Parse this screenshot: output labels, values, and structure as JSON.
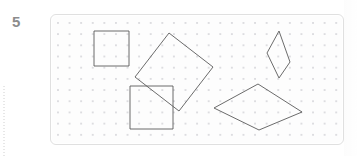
{
  "worksheet": {
    "question_number": "5",
    "panel": {
      "background_color": "#fdfdfd",
      "border_color": "#e0e0e0",
      "dot_color": "#d9d9dd",
      "dot_spacing_x": 11.6,
      "dot_spacing_y": 11.2,
      "width": 294,
      "height": 131
    },
    "shape_stroke_color": "#5a5a5a",
    "number_color": "#8c8c8c"
  },
  "figures": [
    {
      "id": "axis-aligned-square-top-left",
      "name": "square",
      "label": "small axis-aligned square (upper left)",
      "points": "43,16 78,16 78,51 43,51",
      "vertex_count": 4,
      "orientation": "axis-aligned"
    },
    {
      "id": "rotated-square-top-middle",
      "name": "rotated-square",
      "label": "square rotated 45 degrees (upper middle)",
      "points": "118,18 162,52 128,96 84,62",
      "vertex_count": 4,
      "orientation": "rotated"
    },
    {
      "id": "thin-rhombus-top-right",
      "name": "rhombus",
      "label": "tall narrow rhombus (upper right)",
      "points": "228,16 239,47 228,63 216,38",
      "vertex_count": 4,
      "orientation": "vertical"
    },
    {
      "id": "axis-aligned-square-bottom-left",
      "name": "square",
      "label": "large axis-aligned square (lower left)",
      "points": "79,71 122,71 122,114 79,114",
      "vertex_count": 4,
      "orientation": "axis-aligned"
    },
    {
      "id": "wide-rhombus-bottom-right",
      "name": "rhombus",
      "label": "wide flat rhombus (lower right)",
      "points": "163,93 207,69 251,97 208,115",
      "vertex_count": 4,
      "orientation": "horizontal"
    }
  ]
}
